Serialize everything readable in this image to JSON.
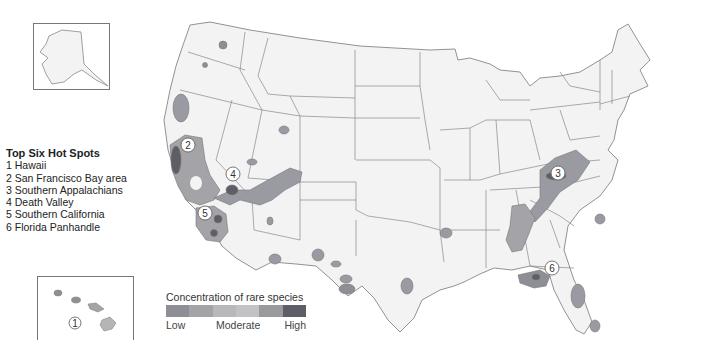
{
  "hotspots_legend": {
    "title": "Top Six Hot Spots",
    "items": [
      "1 Hawaii",
      "2 San Francisco Bay area",
      "3 Southern Appalachians",
      "4 Death Valley",
      "5 Southern California",
      "6 Florida Panhandle"
    ]
  },
  "concentration_legend": {
    "title": "Concentration of rare species",
    "labels": {
      "low": "Low",
      "moderate": "Moderate",
      "high": "High"
    },
    "swatches": [
      "#8e8e96",
      "#a3a3a8",
      "#b8b8ba",
      "#c2c2c4",
      "#9a9a9e",
      "#5e5e66"
    ]
  },
  "map_markers": [
    {
      "id": "1",
      "label": "1",
      "region": "Hawaii"
    },
    {
      "id": "2",
      "label": "2",
      "region": "San Francisco Bay area"
    },
    {
      "id": "3",
      "label": "3",
      "region": "Southern Appalachians"
    },
    {
      "id": "4",
      "label": "4",
      "region": "Death Valley"
    },
    {
      "id": "5",
      "label": "5",
      "region": "Southern California"
    },
    {
      "id": "6",
      "label": "6",
      "region": "Florida Panhandle"
    }
  ],
  "colors": {
    "land": "#f2f2f2",
    "border": "#6a6a6a",
    "low": "#9a9aa2",
    "moderate": "#b5b5b8",
    "high": "#5a5a62"
  }
}
